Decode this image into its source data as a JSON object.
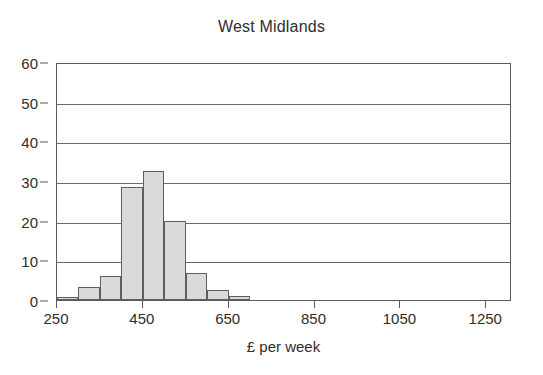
{
  "chart": {
    "title": "West Midlands",
    "xlabel": "£ per week",
    "ylabel": ""
  },
  "axes": {
    "y_ticks": [
      "0",
      "10",
      "20",
      "30",
      "40",
      "50",
      "60"
    ],
    "x_ticks": [
      "250",
      "450",
      "650",
      "850",
      "1050",
      "1250"
    ]
  },
  "colors": {
    "bar_fill": "#dadada",
    "bar_stroke": "#5e5e5e",
    "grid": "#6a6a6a",
    "frame": "#5b5b5b",
    "text": "#2e2e2e",
    "background": "#ffffff"
  },
  "chart_data": {
    "type": "bar",
    "title": "West Midlands",
    "xlabel": "£ per week",
    "ylabel": "",
    "xlim": [
      250,
      1310
    ],
    "ylim": [
      0,
      60
    ],
    "grid": true,
    "legend": null,
    "bin_width": 50,
    "categories": [
      "250-300",
      "300-350",
      "350-400",
      "400-450",
      "450-500",
      "500-550",
      "550-600",
      "600-650",
      "650-700"
    ],
    "bin_edges": [
      250,
      300,
      350,
      400,
      450,
      500,
      550,
      600,
      650,
      700
    ],
    "values": [
      0.8,
      3.4,
      6.0,
      28.5,
      32.5,
      20.0,
      6.8,
      2.5,
      1.0
    ],
    "x_tick_values": [
      250,
      450,
      650,
      850,
      1050,
      1250
    ],
    "y_tick_values": [
      0,
      10,
      20,
      30,
      40,
      50,
      60
    ]
  }
}
